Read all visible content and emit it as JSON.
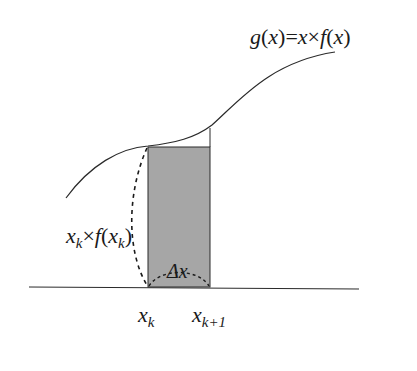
{
  "diagram": {
    "curve_label": {
      "g": "g",
      "open1": "(",
      "x1": "x",
      "close1": ")",
      "eq": "=",
      "x2": "x",
      "times": "×",
      "f": "f",
      "open2": "(",
      "x3": "x",
      "close2": ")"
    },
    "height_label": {
      "x": "x",
      "k_sub": "k",
      "times": "×",
      "f": "f",
      "open": "(",
      "x_inner": "x",
      "k_sub_inner": "k",
      "close": ")"
    },
    "width_label": {
      "delta": "Δ",
      "x": "x"
    },
    "axis_labels": {
      "left": {
        "x": "x",
        "sub": "k"
      },
      "right": {
        "x": "x",
        "sub": "k+1"
      }
    },
    "colors": {
      "rect_fill": "#a6a6a6",
      "line": "#2a2a2a",
      "background": "#ffffff"
    }
  }
}
